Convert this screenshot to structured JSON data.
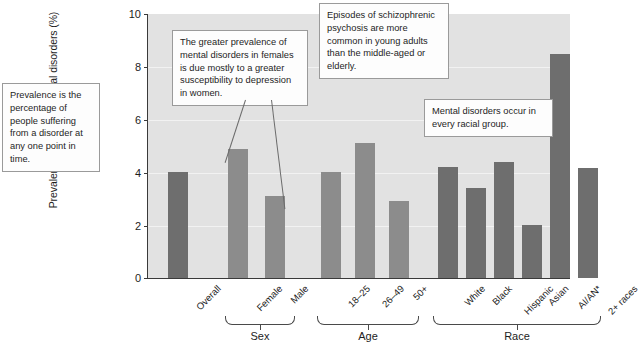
{
  "chart_data": {
    "type": "bar",
    "title": "",
    "xlabel": "",
    "ylabel": "Prevalence of serious mental disorders (%)",
    "ylim": [
      0,
      10
    ],
    "yticks": [
      0,
      2,
      4,
      6,
      8,
      10
    ],
    "grid": true,
    "legend": "none",
    "categories": [
      "Overall",
      "Female",
      "Male",
      "18–25",
      "26–49",
      "50+",
      "White",
      "Black",
      "Hispanic",
      "Asian",
      "AI/AN*",
      "2+ races"
    ],
    "values": [
      4.0,
      4.9,
      3.1,
      4.0,
      5.1,
      2.9,
      4.2,
      3.4,
      4.4,
      2.0,
      8.5,
      4.15
    ],
    "groups": [
      {
        "label": "",
        "categories": [
          "Overall"
        ]
      },
      {
        "label": "Sex",
        "categories": [
          "Female",
          "Male"
        ]
      },
      {
        "label": "Age",
        "categories": [
          "18–25",
          "26–49",
          "50+"
        ]
      },
      {
        "label": "Race",
        "categories": [
          "White",
          "Black",
          "Hispanic",
          "Asian",
          "AI/AN*",
          "2+ races"
        ]
      }
    ]
  },
  "axis": {
    "y_title": "Prevalence of serious mental disorders (%)",
    "ticks": [
      "10",
      "8",
      "6",
      "4",
      "2",
      "0"
    ]
  },
  "bars": [
    {
      "name": "overall",
      "label": "Overall",
      "value": 4.0,
      "x": 20,
      "width": 20,
      "shade": "dark"
    },
    {
      "name": "female",
      "label": "Female",
      "value": 4.9,
      "x": 80,
      "width": 20,
      "shade": "light"
    },
    {
      "name": "male",
      "label": "Male",
      "value": 3.1,
      "x": 117,
      "width": 20,
      "shade": "light"
    },
    {
      "name": "age-18-25",
      "label": "18–25",
      "value": 4.0,
      "x": 173,
      "width": 20,
      "shade": "light"
    },
    {
      "name": "age-26-49",
      "label": "26–49",
      "value": 5.1,
      "x": 207,
      "width": 20,
      "shade": "light"
    },
    {
      "name": "age-50-plus",
      "label": "50+",
      "value": 2.9,
      "x": 241,
      "width": 20,
      "shade": "light"
    },
    {
      "name": "race-white",
      "label": "White",
      "value": 4.2,
      "x": 290,
      "width": 20,
      "shade": "dark"
    },
    {
      "name": "race-black",
      "label": "Black",
      "value": 3.4,
      "x": 318,
      "width": 20,
      "shade": "dark"
    },
    {
      "name": "race-hispanic",
      "label": "Hispanic",
      "value": 4.4,
      "x": 346,
      "width": 20,
      "shade": "dark"
    },
    {
      "name": "race-asian",
      "label": "Asian",
      "value": 2.0,
      "x": 374,
      "width": 20,
      "shade": "dark"
    },
    {
      "name": "race-ai-an",
      "label": "AI/AN*",
      "value": 8.5,
      "x": 402,
      "width": 20,
      "shade": "dark"
    },
    {
      "name": "race-2-plus",
      "label": "2+ races",
      "value": 4.15,
      "x": 430,
      "width": 20,
      "shade": "dark"
    }
  ],
  "group_brackets": [
    {
      "name": "sex",
      "label": "Sex",
      "left": 78,
      "width": 70
    },
    {
      "name": "age",
      "label": "Age",
      "left": 170,
      "width": 102
    },
    {
      "name": "race",
      "label": "Race",
      "left": 286,
      "width": 168
    }
  ],
  "callouts": [
    {
      "name": "prevalence-definition",
      "text": "Prevalence is the percentage of people suffering from a disorder at any one point in time.",
      "left": 2,
      "top": 83,
      "width": 98
    },
    {
      "name": "sex-difference",
      "text": "The greater prevalence of mental disorders in females is due mostly to a greater susceptibility to depression in women.",
      "left": 172,
      "top": 30,
      "width": 136
    },
    {
      "name": "age-psychosis",
      "text": "Episodes of schizophrenic psychosis are more common in young adults than the middle-aged or elderly.",
      "left": 319,
      "top": 3,
      "width": 130
    },
    {
      "name": "race-universality",
      "text": "Mental disorders occur in every racial group.",
      "left": 424,
      "top": 99,
      "width": 129
    }
  ]
}
